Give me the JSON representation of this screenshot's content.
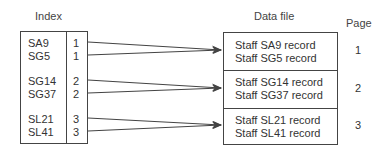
{
  "headers": {
    "index": "Index",
    "data_file": "Data file",
    "page": "Page"
  },
  "index_entries": [
    {
      "key": "SA9",
      "page": "1"
    },
    {
      "key": "SG5",
      "page": "1"
    },
    {
      "key": "SG14",
      "page": "2"
    },
    {
      "key": "SG37",
      "page": "2"
    },
    {
      "key": "SL21",
      "page": "3"
    },
    {
      "key": "SL41",
      "page": "3"
    }
  ],
  "data_pages": [
    {
      "page": "1",
      "records": [
        "Staff SA9 record",
        "Staff SG5 record"
      ]
    },
    {
      "page": "2",
      "records": [
        "Staff SG14 record",
        "Staff SG37 record"
      ]
    },
    {
      "page": "3",
      "records": [
        "Staff SL21 record",
        "Staff SL41 record"
      ]
    }
  ],
  "colors": {
    "line": "#444444",
    "text": "#333333"
  }
}
